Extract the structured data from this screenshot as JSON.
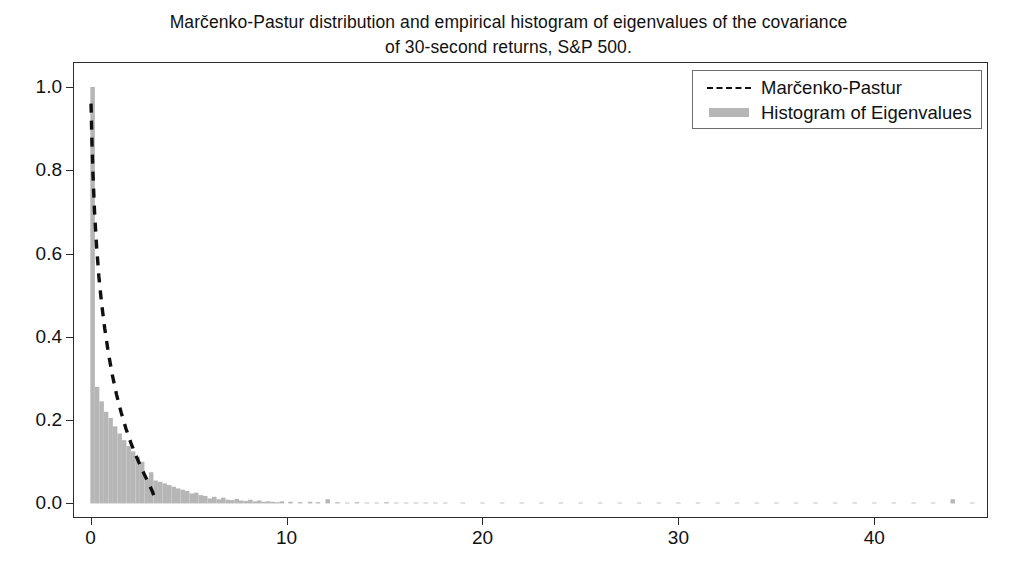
{
  "chart_data": {
    "type": "bar",
    "title": "Marčenko-Pastur distribution and empirical histogram of eigenvalues of the covariance\nof 30-second returns, S&P 500.",
    "xlabel": "",
    "ylabel": "",
    "xlim": [
      -0.9,
      45.8
    ],
    "ylim": [
      -0.035,
      1.06
    ],
    "grid": false,
    "legend_position": "upper right",
    "xticks": [
      0,
      10,
      20,
      30,
      40
    ],
    "xtick_labels": [
      "0",
      "10",
      "20",
      "30",
      "40"
    ],
    "yticks": [
      0.0,
      0.2,
      0.4,
      0.6,
      0.8,
      1.0
    ],
    "ytick_labels": [
      "0.0",
      "0.2",
      "0.4",
      "0.6",
      "0.8",
      "1.0"
    ],
    "series": [
      {
        "name": "Histogram of Eigenvalues",
        "type": "bar",
        "color": "#b6b6b6",
        "bin_width": 0.23,
        "bin_centers": [
          0.1,
          0.33,
          0.56,
          0.79,
          1.02,
          1.25,
          1.48,
          1.71,
          1.94,
          2.17,
          2.4,
          2.63,
          2.86,
          3.09,
          3.32,
          3.55,
          3.78,
          4.01,
          4.24,
          4.47,
          4.7,
          4.93,
          5.16,
          5.39,
          5.62,
          5.85,
          6.08,
          6.31,
          6.54,
          6.77,
          7.0,
          7.23,
          7.46,
          7.69,
          7.92,
          8.15,
          8.38,
          8.61,
          8.84,
          9.07,
          9.3,
          9.53,
          9.76,
          10.2,
          10.7,
          11.2,
          11.6,
          12.1,
          12.6,
          13.1,
          13.6,
          14.1,
          14.6,
          15.1,
          15.6,
          16.1,
          16.6,
          17.1,
          17.6,
          18.1,
          19.0,
          20.0,
          21.0,
          22.0,
          23.0,
          24.0,
          25.0,
          26.0,
          27.0,
          28.0,
          29.0,
          30.0,
          31.0,
          32.0,
          33.0,
          34.0,
          35.0,
          36.0,
          37.0,
          38.0,
          39.0,
          40.0,
          41.0,
          42.0,
          43.0,
          44.0,
          45.0
        ],
        "values": [
          1.0,
          0.28,
          0.245,
          0.22,
          0.205,
          0.185,
          0.168,
          0.152,
          0.138,
          0.125,
          0.112,
          0.1,
          0.06,
          0.075,
          0.055,
          0.052,
          0.048,
          0.044,
          0.04,
          0.036,
          0.033,
          0.03,
          0.024,
          0.026,
          0.02,
          0.018,
          0.012,
          0.016,
          0.01,
          0.014,
          0.009,
          0.008,
          0.011,
          0.007,
          0.006,
          0.009,
          0.005,
          0.007,
          0.004,
          0.005,
          0.004,
          0.003,
          0.005,
          0.004,
          0.003,
          0.004,
          0.003,
          0.01,
          0.003,
          0.002,
          0.003,
          0.002,
          0.002,
          0.003,
          0.002,
          0.002,
          0.002,
          0.002,
          0.002,
          0.002,
          0.002,
          0.002,
          0.002,
          0.002,
          0.002,
          0.002,
          0.002,
          0.002,
          0.002,
          0.002,
          0.002,
          0.002,
          0.002,
          0.002,
          0.002,
          0.002,
          0.002,
          0.002,
          0.002,
          0.002,
          0.002,
          0.002,
          0.002,
          0.002,
          0.002,
          0.01,
          0.002
        ]
      },
      {
        "name": "Marčenko-Pastur",
        "type": "line",
        "linestyle": "dashed",
        "color": "#101010",
        "x": [
          0.02,
          0.06,
          0.12,
          0.2,
          0.3,
          0.42,
          0.56,
          0.72,
          0.9,
          1.1,
          1.32,
          1.56,
          1.8,
          2.05,
          2.3,
          2.55,
          2.78,
          2.98,
          3.14,
          3.25,
          3.31
        ],
        "y": [
          0.96,
          0.88,
          0.79,
          0.7,
          0.62,
          0.545,
          0.48,
          0.42,
          0.363,
          0.31,
          0.262,
          0.218,
          0.18,
          0.146,
          0.116,
          0.089,
          0.066,
          0.046,
          0.03,
          0.016,
          0.005
        ]
      }
    ]
  },
  "legend": {
    "entries": [
      {
        "label": "Marčenko-Pastur",
        "key": "dashed-line-key"
      },
      {
        "label": "Histogram of Eigenvalues",
        "key": "gray-patch-key"
      }
    ]
  },
  "colors": {
    "histogram": "#b6b6b6",
    "curve": "#101010",
    "axis": "#2b2b2b",
    "background": "#ffffff"
  }
}
